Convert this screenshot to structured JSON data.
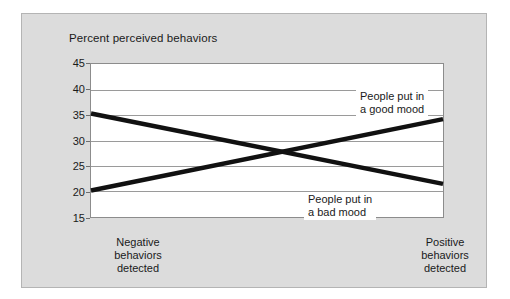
{
  "chart_data": {
    "type": "line",
    "title": "Percent perceived behaviors",
    "xlabel": "",
    "ylabel": "Percent perceived behaviors",
    "ylim": [
      15,
      45
    ],
    "yticks": [
      45,
      40,
      35,
      30,
      25,
      20,
      15
    ],
    "grid": true,
    "legend_position": "inline-annotations",
    "categories": [
      "Negative behaviors detected",
      "Positive behaviors detected"
    ],
    "series": [
      {
        "name": "People put in a good mood",
        "values": [
          20.2,
          34.2
        ],
        "annotation": "People put in a good mood",
        "color": "#111111"
      },
      {
        "name": "People put in a bad mood",
        "values": [
          35.3,
          21.5
        ],
        "annotation": "People put in a bad mood",
        "color": "#111111"
      }
    ]
  },
  "chart": {
    "title": "Percent perceived behaviors",
    "y_ticks": [
      {
        "label": "45",
        "value": 45
      },
      {
        "label": "40",
        "value": 40
      },
      {
        "label": "35",
        "value": 35
      },
      {
        "label": "30",
        "value": 30
      },
      {
        "label": "25",
        "value": 25
      },
      {
        "label": "20",
        "value": 20
      },
      {
        "label": "15",
        "value": 15
      }
    ],
    "x_labels": [
      {
        "line1": "Negative",
        "line2": "behaviors",
        "line3": "detected"
      },
      {
        "line1": "Positive",
        "line2": "behaviors",
        "line3": "detected"
      }
    ],
    "annotations": [
      {
        "line1": "People put in",
        "line2": "a good mood"
      },
      {
        "line1": "People put in",
        "line2": "a bad mood"
      }
    ],
    "colors": {
      "background": "#dcdcdc",
      "panel": "#ffffff",
      "line": "#111111",
      "grid": "#9a9a9a",
      "text": "#1a1a1a"
    }
  }
}
